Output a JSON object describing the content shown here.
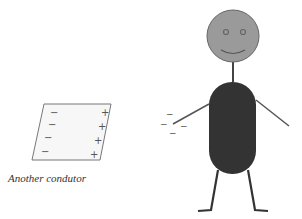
{
  "conductor": {
    "caption": "Another condutor",
    "left_charges": [
      "−",
      "−",
      "−",
      "−"
    ],
    "right_charges": [
      "+",
      "+",
      "+",
      "+"
    ],
    "fill": "#f7f7f7",
    "stroke": "#777777"
  },
  "person": {
    "head_color": "#999999",
    "body_color": "#333333",
    "limb_color": "#444444"
  },
  "hand_charges": [
    "−",
    "−",
    "−",
    "−"
  ]
}
